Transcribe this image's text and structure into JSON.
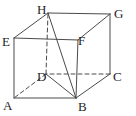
{
  "figure": {
    "name": "labeled-cube-with-diagonals",
    "width": 136,
    "height": 116,
    "background_color": "#ffffff",
    "line_color": "#4a4a4a",
    "label_color": "#262626",
    "stroke_width": 1,
    "dash_pattern": "4 3"
  },
  "vertices": [
    {
      "id": "A",
      "label": "A",
      "x": 14,
      "y": 98,
      "label_x": 3,
      "label_y": 99,
      "hidden": false
    },
    {
      "id": "B",
      "label": "B",
      "x": 76,
      "y": 98,
      "label_x": 78,
      "label_y": 100,
      "hidden": false
    },
    {
      "id": "C",
      "label": "C",
      "x": 110,
      "y": 74,
      "label_x": 113,
      "label_y": 70,
      "hidden": false
    },
    {
      "id": "D",
      "label": "D",
      "x": 46,
      "y": 74,
      "label_x": 37,
      "label_y": 70,
      "hidden": true
    },
    {
      "id": "E",
      "label": "E",
      "x": 14,
      "y": 38,
      "label_x": 2,
      "label_y": 35,
      "hidden": false
    },
    {
      "id": "F",
      "label": "F",
      "x": 78,
      "y": 40,
      "label_x": 78,
      "label_y": 34,
      "hidden": false
    },
    {
      "id": "G",
      "label": "G",
      "x": 110,
      "y": 14,
      "label_x": 114,
      "label_y": 7,
      "hidden": false
    },
    {
      "id": "H",
      "label": "H",
      "x": 48,
      "y": 13,
      "label_x": 37,
      "label_y": 3,
      "hidden": false
    }
  ],
  "edges": [
    {
      "name": "edge-A-B",
      "from": "A",
      "to": "B",
      "style": "solid"
    },
    {
      "name": "edge-B-C",
      "from": "B",
      "to": "C",
      "style": "solid"
    },
    {
      "name": "edge-C-D",
      "from": "C",
      "to": "D",
      "style": "dashed"
    },
    {
      "name": "edge-D-A",
      "from": "D",
      "to": "A",
      "style": "dashed"
    },
    {
      "name": "edge-E-F",
      "from": "E",
      "to": "F",
      "style": "solid"
    },
    {
      "name": "edge-F-G",
      "from": "F",
      "to": "G",
      "style": "solid"
    },
    {
      "name": "edge-G-H",
      "from": "G",
      "to": "H",
      "style": "solid"
    },
    {
      "name": "edge-H-E",
      "from": "H",
      "to": "E",
      "style": "solid"
    },
    {
      "name": "edge-A-E",
      "from": "A",
      "to": "E",
      "style": "solid"
    },
    {
      "name": "edge-B-F",
      "from": "B",
      "to": "F",
      "style": "solid"
    },
    {
      "name": "edge-C-G",
      "from": "C",
      "to": "G",
      "style": "solid"
    },
    {
      "name": "edge-D-H",
      "from": "D",
      "to": "H",
      "style": "dashed"
    }
  ],
  "diagonals": [
    {
      "name": "diagonal-H-B",
      "from": "H",
      "to": "B",
      "style": "solid"
    },
    {
      "name": "diagonal-D-B",
      "from": "D",
      "to": "B",
      "style": "solid"
    }
  ]
}
